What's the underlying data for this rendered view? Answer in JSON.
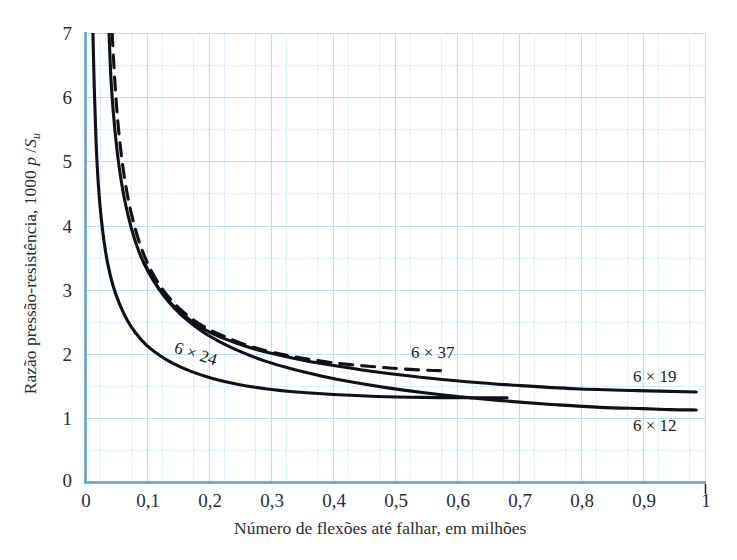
{
  "chart_data": {
    "type": "line",
    "title": "",
    "xlabel": "Número de flexões até falhar, em milhões",
    "ylabel_parts": {
      "prefix": "Razão pressão-resistência, 1000 ",
      "p": "p",
      "slash": " /",
      "S": "S",
      "sub": "u"
    },
    "ylabel": "Razão pressão-resistência, 1000 p /Su",
    "xlim": [
      0,
      1
    ],
    "ylim": [
      0,
      7
    ],
    "xticks": [
      "0",
      "0,1",
      "0,2",
      "0,3",
      "0,4",
      "0,5",
      "0,6",
      "0,7",
      "0,8",
      "0,9",
      "1"
    ],
    "xtick_values": [
      0,
      0.1,
      0.2,
      0.3,
      0.4,
      0.5,
      0.6,
      0.7,
      0.8,
      0.9,
      1
    ],
    "yticks": [
      "0",
      "1",
      "2",
      "3",
      "4",
      "5",
      "6",
      "7"
    ],
    "ytick_values": [
      0,
      1,
      2,
      3,
      4,
      5,
      6,
      7
    ],
    "grid": true,
    "grid_major_x_step": 0.1,
    "grid_minor_x_step": 0.05,
    "grid_major_y_step": 1,
    "grid_minor_y_step": 0.5,
    "grid_color": "#bcdcf2",
    "grid_minor_color": "#dceefb",
    "axis_color": "#5b9bd5",
    "curve_color": "#101018",
    "legend": "inline-annotations",
    "series": [
      {
        "name": "6 × 24",
        "style": "solid",
        "label_position": "inline-left",
        "points": [
          [
            0.012,
            7.0
          ],
          [
            0.014,
            6.2
          ],
          [
            0.016,
            5.6
          ],
          [
            0.018,
            5.1
          ],
          [
            0.021,
            4.6
          ],
          [
            0.025,
            4.15
          ],
          [
            0.03,
            3.75
          ],
          [
            0.036,
            3.4
          ],
          [
            0.044,
            3.08
          ],
          [
            0.054,
            2.8
          ],
          [
            0.066,
            2.55
          ],
          [
            0.08,
            2.34
          ],
          [
            0.097,
            2.15
          ],
          [
            0.118,
            1.99
          ],
          [
            0.142,
            1.85
          ],
          [
            0.17,
            1.73
          ],
          [
            0.205,
            1.62
          ],
          [
            0.245,
            1.53
          ],
          [
            0.29,
            1.46
          ],
          [
            0.34,
            1.41
          ],
          [
            0.4,
            1.37
          ],
          [
            0.47,
            1.34
          ],
          [
            0.545,
            1.325
          ],
          [
            0.62,
            1.32
          ],
          [
            0.68,
            1.32
          ]
        ]
      },
      {
        "name": "6 × 37",
        "style": "dashed",
        "label_position": "above-right",
        "points": [
          [
            0.043,
            7.0
          ],
          [
            0.047,
            6.3
          ],
          [
            0.051,
            5.75
          ],
          [
            0.056,
            5.25
          ],
          [
            0.062,
            4.8
          ],
          [
            0.07,
            4.36
          ],
          [
            0.08,
            3.96
          ],
          [
            0.092,
            3.6
          ],
          [
            0.107,
            3.28
          ],
          [
            0.125,
            3.0
          ],
          [
            0.146,
            2.76
          ],
          [
            0.17,
            2.56
          ],
          [
            0.198,
            2.39
          ],
          [
            0.23,
            2.25
          ],
          [
            0.266,
            2.12
          ],
          [
            0.305,
            2.02
          ],
          [
            0.348,
            1.94
          ],
          [
            0.395,
            1.87
          ],
          [
            0.445,
            1.82
          ],
          [
            0.495,
            1.78
          ],
          [
            0.545,
            1.75
          ],
          [
            0.58,
            1.74
          ]
        ]
      },
      {
        "name": "6 × 19",
        "style": "solid",
        "label_position": "right-end",
        "points": [
          [
            0.038,
            7.0
          ],
          [
            0.041,
            6.3
          ],
          [
            0.045,
            5.75
          ],
          [
            0.05,
            5.25
          ],
          [
            0.056,
            4.8
          ],
          [
            0.064,
            4.36
          ],
          [
            0.074,
            3.96
          ],
          [
            0.086,
            3.6
          ],
          [
            0.1,
            3.3
          ],
          [
            0.118,
            3.02
          ],
          [
            0.139,
            2.78
          ],
          [
            0.163,
            2.57
          ],
          [
            0.191,
            2.39
          ],
          [
            0.224,
            2.24
          ],
          [
            0.262,
            2.11
          ],
          [
            0.305,
            2.0
          ],
          [
            0.353,
            1.9
          ],
          [
            0.408,
            1.81
          ],
          [
            0.47,
            1.72
          ],
          [
            0.54,
            1.64
          ],
          [
            0.615,
            1.57
          ],
          [
            0.7,
            1.51
          ],
          [
            0.79,
            1.46
          ],
          [
            0.89,
            1.43
          ],
          [
            0.985,
            1.41
          ]
        ]
      },
      {
        "name": "6 × 12",
        "style": "solid",
        "label_position": "right-end-below",
        "points": [
          [
            0.095,
            3.42
          ],
          [
            0.108,
            3.18
          ],
          [
            0.124,
            2.94
          ],
          [
            0.143,
            2.72
          ],
          [
            0.165,
            2.52
          ],
          [
            0.19,
            2.34
          ],
          [
            0.219,
            2.18
          ],
          [
            0.252,
            2.03
          ],
          [
            0.29,
            1.89
          ],
          [
            0.332,
            1.77
          ],
          [
            0.38,
            1.66
          ],
          [
            0.432,
            1.56
          ],
          [
            0.49,
            1.47
          ],
          [
            0.553,
            1.39
          ],
          [
            0.62,
            1.32
          ],
          [
            0.69,
            1.26
          ],
          [
            0.76,
            1.21
          ],
          [
            0.83,
            1.17
          ],
          [
            0.9,
            1.15
          ],
          [
            0.945,
            1.135
          ],
          [
            0.985,
            1.13
          ]
        ]
      }
    ],
    "annotations": [
      {
        "text": "6 × 24",
        "x": 0.18,
        "y": 2.05,
        "rotation": -18
      },
      {
        "text": "6 × 37",
        "x": 0.53,
        "y": 2.13,
        "rotation": 0
      },
      {
        "text": "6 × 19",
        "x": 0.885,
        "y": 1.78,
        "rotation": 0
      },
      {
        "text": "6 × 12",
        "x": 0.885,
        "y": 1.03,
        "rotation": 0
      }
    ]
  }
}
